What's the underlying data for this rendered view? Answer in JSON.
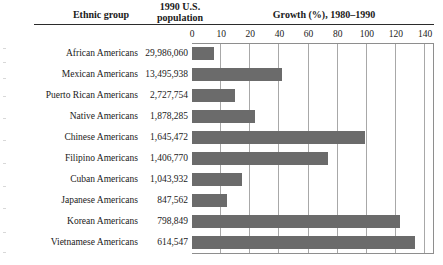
{
  "header": {
    "ethnic_group": "Ethnic group",
    "population_line1": "1990 U.S.",
    "population_line2": "population",
    "growth": "Growth (%), 1980–1990"
  },
  "chart_data": {
    "type": "bar",
    "orientation": "horizontal",
    "title": "Growth (%), 1980–1990",
    "xlabel": "Growth (%), 1980–1990",
    "ylabel": "Ethnic group",
    "xlim": [
      0,
      140
    ],
    "grid": true,
    "legend": "none",
    "bar_color": "#6b6b6b",
    "axis_color": "#8e8e8e",
    "tick_labels": [
      "0",
      "10",
      "20",
      "40",
      "60",
      "80",
      "100",
      "120",
      "140"
    ],
    "tick_values": [
      0,
      10,
      20,
      40,
      60,
      80,
      100,
      120,
      140
    ],
    "categories": [
      "African Americans",
      "Mexican Americans",
      "Puerto Rican Americans",
      "Native Americans",
      "Chinese Americans",
      "Filipino Americans",
      "Cuban Americans",
      "Japanese Americans",
      "Korean Americans",
      "Vietnamese Americans"
    ],
    "values": [
      13,
      54,
      26,
      38,
      104,
      82,
      30,
      21,
      125,
      134
    ],
    "populations": [
      "29,986,060",
      "13,495,938",
      "2,727,754",
      "1,878,285",
      "1,645,472",
      "1,406,770",
      "1,043,932",
      "847,562",
      "798,849",
      "614,547"
    ]
  }
}
